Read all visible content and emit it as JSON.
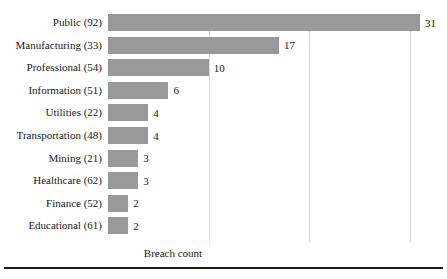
{
  "chart_data": {
    "type": "bar",
    "orientation": "horizontal",
    "title": "",
    "subtitle": "",
    "xlabel": "Breach count",
    "ylabel": "",
    "categories": [
      "Public (92)",
      "Manufacturing (33)",
      "Professional (54)",
      "Information (51)",
      "Utilities (22)",
      "Transportation (48)",
      "Mining (21)",
      "Healthcare (62)",
      "Finance (52)",
      "Educational (61)"
    ],
    "values": [
      31,
      17,
      10,
      6,
      4,
      4,
      3,
      3,
      2,
      2
    ],
    "value_labels": [
      "31",
      "17",
      "10",
      "6",
      "4",
      "4",
      "3",
      "3",
      "2",
      "2"
    ],
    "xlim": [
      0,
      31
    ],
    "ylim": [],
    "gridlines": {
      "axis": "x",
      "visible": true,
      "values": [
        10,
        20,
        30
      ],
      "labels_visible": false
    },
    "legend": {
      "visible": false,
      "position": "none",
      "entries": []
    },
    "annotations": [],
    "colors": {
      "bar": "#999999",
      "gridline": "#d9d9d9",
      "text": "#1a1a1a",
      "background": "#ffffff",
      "rule": "#1a1a1a"
    }
  }
}
